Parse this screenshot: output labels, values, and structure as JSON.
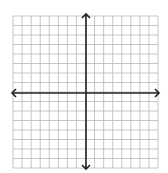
{
  "diagram": {
    "type": "coordinate-plane",
    "grid": {
      "x0": 13,
      "y0": 16,
      "x1": 158,
      "y1": 168,
      "cols": 16,
      "rows": 16,
      "color": "#b8b8b8"
    },
    "axes": {
      "origin_x": 86,
      "origin_y": 93,
      "color": "#222222",
      "x_axis_arrows": "both",
      "y_axis_arrows": "both"
    }
  }
}
